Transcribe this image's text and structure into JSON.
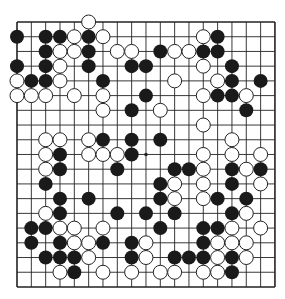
{
  "board": {
    "size": 19,
    "origin_x": 17,
    "origin_y": 22,
    "spacing_x": 14.33,
    "spacing_y": 14.72,
    "stone_radius": 7,
    "line_color": "#222222",
    "border_width": 1.6,
    "black_color": "#1a1a1a",
    "white_fill": "#ffffff",
    "white_stroke": "#222222",
    "hoshi": [
      [
        3,
        3
      ],
      [
        9,
        3
      ],
      [
        15,
        3
      ],
      [
        3,
        9
      ],
      [
        9,
        9
      ],
      [
        15,
        9
      ],
      [
        3,
        15
      ],
      [
        9,
        15
      ],
      [
        15,
        15
      ]
    ],
    "stones": {
      "black": [
        [
          0,
          1
        ],
        [
          2,
          1
        ],
        [
          3,
          1
        ],
        [
          5,
          1
        ],
        [
          14,
          1
        ],
        [
          2,
          2
        ],
        [
          5,
          2
        ],
        [
          10,
          2
        ],
        [
          13,
          2
        ],
        [
          14,
          2
        ],
        [
          0,
          3
        ],
        [
          2,
          3
        ],
        [
          5,
          3
        ],
        [
          8,
          3
        ],
        [
          9,
          3
        ],
        [
          15,
          3
        ],
        [
          1,
          4
        ],
        [
          2,
          4
        ],
        [
          6,
          4
        ],
        [
          15,
          4
        ],
        [
          17,
          4
        ],
        [
          9,
          5
        ],
        [
          14,
          5
        ],
        [
          15,
          5
        ],
        [
          8,
          6
        ],
        [
          16,
          6
        ],
        [
          6,
          8
        ],
        [
          8,
          8
        ],
        [
          10,
          8
        ],
        [
          3,
          9
        ],
        [
          8,
          9
        ],
        [
          3,
          10
        ],
        [
          7,
          10
        ],
        [
          11,
          10
        ],
        [
          12,
          10
        ],
        [
          15,
          10
        ],
        [
          17,
          10
        ],
        [
          2,
          11
        ],
        [
          10,
          11
        ],
        [
          15,
          11
        ],
        [
          3,
          12
        ],
        [
          5,
          12
        ],
        [
          10,
          12
        ],
        [
          14,
          12
        ],
        [
          16,
          12
        ],
        [
          3,
          13
        ],
        [
          7,
          13
        ],
        [
          9,
          13
        ],
        [
          11,
          13
        ],
        [
          15,
          13
        ],
        [
          1,
          14
        ],
        [
          2,
          14
        ],
        [
          10,
          14
        ],
        [
          13,
          14
        ],
        [
          14,
          14
        ],
        [
          1,
          15
        ],
        [
          3,
          15
        ],
        [
          6,
          15
        ],
        [
          8,
          15
        ],
        [
          13,
          15
        ],
        [
          2,
          16
        ],
        [
          3,
          16
        ],
        [
          4,
          16
        ],
        [
          8,
          16
        ],
        [
          11,
          16
        ],
        [
          12,
          16
        ],
        [
          13,
          16
        ],
        [
          15,
          16
        ],
        [
          4,
          17
        ],
        [
          15,
          17
        ]
      ],
      "white": [
        [
          5,
          0
        ],
        [
          4,
          1
        ],
        [
          6,
          1
        ],
        [
          13,
          1
        ],
        [
          3,
          2
        ],
        [
          4,
          2
        ],
        [
          7,
          2
        ],
        [
          8,
          2
        ],
        [
          11,
          2
        ],
        [
          12,
          2
        ],
        [
          3,
          3
        ],
        [
          13,
          3
        ],
        [
          0,
          4
        ],
        [
          3,
          4
        ],
        [
          11,
          4
        ],
        [
          14,
          4
        ],
        [
          0,
          5
        ],
        [
          1,
          5
        ],
        [
          2,
          5
        ],
        [
          4,
          5
        ],
        [
          6,
          5
        ],
        [
          13,
          5
        ],
        [
          16,
          5
        ],
        [
          6,
          6
        ],
        [
          10,
          6
        ],
        [
          13,
          7
        ],
        [
          2,
          8
        ],
        [
          3,
          8
        ],
        [
          5,
          8
        ],
        [
          15,
          8
        ],
        [
          2,
          9
        ],
        [
          5,
          9
        ],
        [
          6,
          9
        ],
        [
          7,
          9
        ],
        [
          13,
          9
        ],
        [
          15,
          9
        ],
        [
          17,
          9
        ],
        [
          2,
          10
        ],
        [
          13,
          10
        ],
        [
          16,
          10
        ],
        [
          11,
          11
        ],
        [
          13,
          11
        ],
        [
          17,
          11
        ],
        [
          11,
          12
        ],
        [
          13,
          12
        ],
        [
          2,
          13
        ],
        [
          16,
          13
        ],
        [
          3,
          14
        ],
        [
          4,
          14
        ],
        [
          6,
          14
        ],
        [
          15,
          14
        ],
        [
          17,
          14
        ],
        [
          4,
          15
        ],
        [
          5,
          15
        ],
        [
          9,
          15
        ],
        [
          14,
          15
        ],
        [
          15,
          15
        ],
        [
          16,
          15
        ],
        [
          5,
          16
        ],
        [
          9,
          16
        ],
        [
          14,
          16
        ],
        [
          16,
          16
        ],
        [
          3,
          17
        ],
        [
          6,
          17
        ],
        [
          8,
          17
        ],
        [
          10,
          17
        ],
        [
          11,
          17
        ],
        [
          13,
          17
        ],
        [
          14,
          17
        ]
      ]
    }
  }
}
